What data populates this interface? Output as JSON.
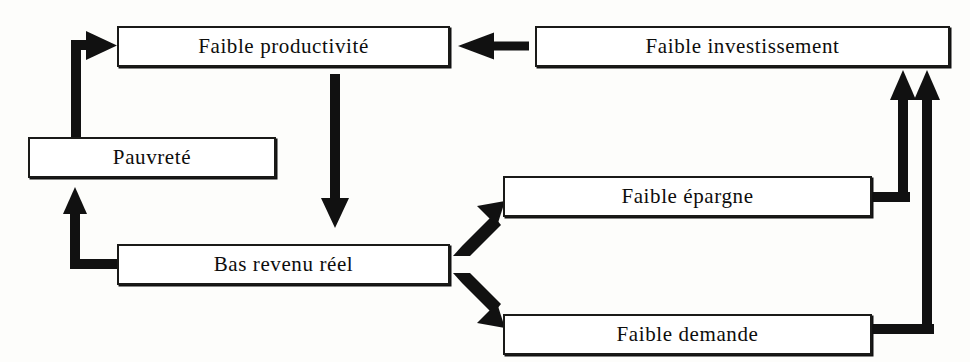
{
  "diagram": {
    "background_color": "#fdfdfb",
    "ink_color": "#111111",
    "box_fill_color": "#ffffff",
    "nodes": [
      {
        "id": "faible-productivite",
        "label": "Faible productivité"
      },
      {
        "id": "faible-investissement",
        "label": "Faible investissement"
      },
      {
        "id": "pauvrete",
        "label": "Pauvreté"
      },
      {
        "id": "faible-epargne",
        "label": "Faible épargne"
      },
      {
        "id": "bas-revenu-reel",
        "label": "Bas revenu réel"
      },
      {
        "id": "faible-demande",
        "label": "Faible demande"
      }
    ],
    "edges": [
      {
        "id": "investissement-to-productivite",
        "from": "faible-investissement",
        "to": "faible-productivite",
        "style": "straight-left"
      },
      {
        "id": "productivite-to-bas-revenu",
        "from": "faible-productivite",
        "to": "bas-revenu-reel",
        "style": "straight-down"
      },
      {
        "id": "bas-revenu-to-pauvrete",
        "from": "bas-revenu-reel",
        "to": "pauvrete",
        "style": "elbow-left-up"
      },
      {
        "id": "pauvrete-to-productivite",
        "from": "pauvrete",
        "to": "faible-productivite",
        "style": "elbow-up-right"
      },
      {
        "id": "bas-revenu-to-epargne",
        "from": "bas-revenu-reel",
        "to": "faible-epargne",
        "style": "diagonal-up-right"
      },
      {
        "id": "bas-revenu-to-demande",
        "from": "bas-revenu-reel",
        "to": "faible-demande",
        "style": "diagonal-down-right"
      },
      {
        "id": "epargne-to-investissement",
        "from": "faible-epargne",
        "to": "faible-investissement",
        "style": "elbow-right-up"
      },
      {
        "id": "demande-to-investissement",
        "from": "faible-demande",
        "to": "faible-investissement",
        "style": "elbow-right-up"
      }
    ]
  }
}
